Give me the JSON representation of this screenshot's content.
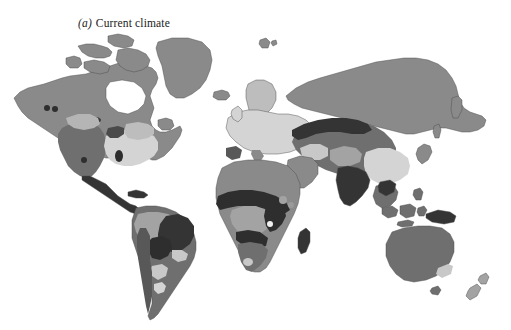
{
  "figure": {
    "panel_letter": "(a)",
    "caption": "Current climate",
    "background_color": "#ffffff",
    "type": "world-map-thematic",
    "projection_note": "world map, grayscale climate zones"
  },
  "legend_tones": {
    "tone_very_light": "#e2e2e2",
    "tone_light": "#d4d4d4",
    "tone_light_mid": "#bdbdbd",
    "tone_mid": "#a3a3a3",
    "tone_mid_dark": "#8a8a8a",
    "tone_dark": "#6f6f6f",
    "tone_darker": "#585858",
    "tone_darkest": "#343434",
    "outline": "#3c3c3c"
  },
  "map_regions": [
    {
      "name": "greenland",
      "tone": "#8a8a8a"
    },
    {
      "name": "canada-arctic",
      "tone": "#8a8a8a"
    },
    {
      "name": "alaska",
      "tone": "#8a8a8a"
    },
    {
      "name": "western-united-states",
      "tone": "#6f6f6f"
    },
    {
      "name": "eastern-united-states",
      "tone": "#d4d4d4"
    },
    {
      "name": "mexico-central-america",
      "tone": "#343434"
    },
    {
      "name": "amazon-basin",
      "tone": "#a3a3a3"
    },
    {
      "name": "brazil-cerrado",
      "tone": "#343434"
    },
    {
      "name": "southern-south-america",
      "tone": "#8a8a8a"
    },
    {
      "name": "patagonia",
      "tone": "#6f6f6f"
    },
    {
      "name": "scandinavia",
      "tone": "#bdbdbd"
    },
    {
      "name": "europe",
      "tone": "#d4d4d4"
    },
    {
      "name": "siberia",
      "tone": "#8a8a8a"
    },
    {
      "name": "central-asia",
      "tone": "#6f6f6f"
    },
    {
      "name": "china",
      "tone": "#d4d4d4"
    },
    {
      "name": "india",
      "tone": "#343434"
    },
    {
      "name": "southeast-asia",
      "tone": "#6f6f6f"
    },
    {
      "name": "sahara",
      "tone": "#8a8a8a"
    },
    {
      "name": "sahel",
      "tone": "#343434"
    },
    {
      "name": "congo-basin",
      "tone": "#a3a3a3"
    },
    {
      "name": "east-africa",
      "tone": "#343434"
    },
    {
      "name": "southern-africa",
      "tone": "#6f6f6f"
    },
    {
      "name": "madagascar",
      "tone": "#343434"
    },
    {
      "name": "australia",
      "tone": "#6f6f6f"
    },
    {
      "name": "new-guinea",
      "tone": "#343434"
    },
    {
      "name": "new-zealand",
      "tone": "#a3a3a3"
    },
    {
      "name": "iceland",
      "tone": "#8a8a8a"
    },
    {
      "name": "svalbard",
      "tone": "#8a8a8a"
    },
    {
      "name": "japan",
      "tone": "#8a8a8a"
    },
    {
      "name": "kamchatka",
      "tone": "#8a8a8a"
    }
  ]
}
